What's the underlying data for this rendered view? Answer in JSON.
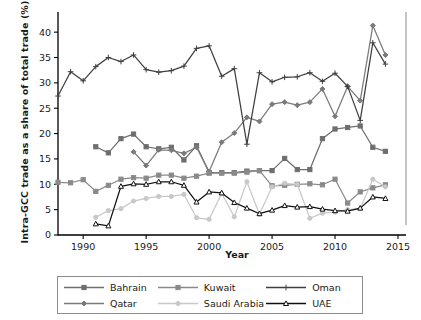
{
  "chart_data": {
    "type": "line",
    "title": "",
    "xlabel": "Year",
    "ylabel": "Intra-GCC trade as a share of total trade (%)",
    "xlim": [
      1988,
      2015
    ],
    "ylim": [
      0,
      42
    ],
    "xticks": [
      1990,
      1995,
      2000,
      2005,
      2010,
      2015
    ],
    "yticks": [
      0,
      5,
      10,
      15,
      20,
      25,
      30,
      35,
      40
    ],
    "grid": false,
    "legend_position": "below",
    "x": [
      1988,
      1989,
      1990,
      1991,
      1992,
      1993,
      1994,
      1995,
      1996,
      1997,
      1998,
      1999,
      2000,
      2001,
      2002,
      2003,
      2004,
      2005,
      2006,
      2007,
      2008,
      2009,
      2010,
      2011,
      2012,
      2013,
      2014
    ],
    "series": [
      {
        "name": "Bahrain",
        "color": "#6e6e6e",
        "marker": "square",
        "values": [
          null,
          null,
          null,
          17.4,
          16.2,
          19.0,
          19.9,
          17.4,
          17.0,
          17.3,
          14.8,
          17.6,
          12.3,
          12.3,
          12.3,
          12.6,
          12.7,
          12.7,
          15.1,
          12.9,
          12.9,
          19.0,
          20.9,
          21.2,
          21.5,
          17.3,
          16.5
        ]
      },
      {
        "name": "Qatar",
        "color": "#7a7a7a",
        "marker": "diamond",
        "values": [
          null,
          null,
          null,
          null,
          null,
          null,
          16.4,
          13.7,
          16.8,
          16.7,
          16.1,
          17.3,
          12.5,
          18.3,
          20.1,
          23.2,
          22.4,
          25.8,
          26.2,
          25.6,
          26.2,
          28.8,
          23.4,
          29.3,
          26.5,
          41.3,
          35.5
        ]
      },
      {
        "name": "Kuwait",
        "color": "#8a8a8a",
        "marker": "square",
        "values": [
          10.4,
          10.3,
          10.9,
          8.6,
          9.8,
          11.0,
          11.3,
          11.2,
          11.8,
          11.8,
          11.2,
          11.6,
          12.2,
          12.2,
          12.2,
          12.4,
          12.7,
          9.7,
          9.8,
          10.0,
          10.1,
          9.9,
          11.0,
          6.3,
          8.5,
          9.3,
          9.9
        ]
      },
      {
        "name": "Saudi Arabia",
        "color": "#c8c8c8",
        "marker": "circle",
        "values": [
          null,
          null,
          null,
          3.5,
          4.8,
          5.2,
          6.7,
          7.2,
          7.6,
          7.6,
          8.0,
          3.4,
          3.1,
          8.2,
          3.6,
          10.5,
          4.1,
          9.5,
          10.2,
          10.0,
          3.3,
          4.3,
          4.5,
          5.0,
          5.2,
          11.0,
          9.5
        ]
      },
      {
        "name": "Oman",
        "color": "#3f3f3f",
        "marker": "plus",
        "values": [
          27.4,
          32.2,
          30.4,
          33.2,
          35.0,
          34.2,
          35.5,
          32.6,
          32.1,
          32.4,
          33.3,
          36.8,
          37.3,
          31.3,
          32.8,
          17.9,
          32.0,
          30.2,
          31.1,
          31.2,
          32.0,
          30.3,
          31.9,
          29.3,
          22.6,
          37.9,
          33.7
        ]
      },
      {
        "name": "UAE",
        "color": "#111111",
        "marker": "triangle",
        "values": [
          null,
          null,
          null,
          2.2,
          1.8,
          9.6,
          10.1,
          10.0,
          10.5,
          10.5,
          9.8,
          6.5,
          8.5,
          8.3,
          6.4,
          5.3,
          4.2,
          4.9,
          5.8,
          5.5,
          5.6,
          5.1,
          4.8,
          4.7,
          5.3,
          7.5,
          7.2
        ]
      }
    ]
  },
  "legend": {
    "items": [
      {
        "label": "Bahrain"
      },
      {
        "label": "Kuwait"
      },
      {
        "label": "Oman"
      },
      {
        "label": "Qatar"
      },
      {
        "label": "Saudi Arabia"
      },
      {
        "label": "UAE"
      }
    ]
  }
}
